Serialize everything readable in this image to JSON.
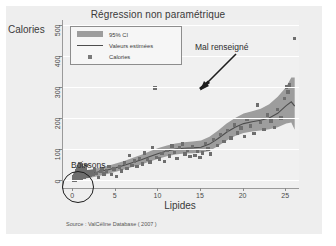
{
  "chart_data": {
    "type": "scatter",
    "title": "Régression non paramétrique",
    "xlabel": "Lipides",
    "ylabel": "Calories",
    "source": "Source : ValCéline Database ( 2007 )",
    "xlim": [
      -1.2,
      26.5
    ],
    "ylim": [
      -25,
      515
    ],
    "xticks": [
      0,
      5,
      10,
      15,
      20,
      25
    ],
    "yticks": [
      0,
      100,
      200,
      300,
      400,
      500
    ],
    "grid": "horizontal",
    "legend_position": "top-left",
    "legend": [
      {
        "key": "band",
        "label": "95% CI"
      },
      {
        "key": "line",
        "label": "Valeurs estimées"
      },
      {
        "key": "marker",
        "label": "Calories"
      }
    ],
    "annotations": [
      {
        "text": "Mal renseigné",
        "points_to": [
          9.6,
          297
        ]
      },
      {
        "text": "Boissons",
        "circles": [
          0.7,
          18
        ]
      }
    ],
    "series": [
      {
        "name": "Calories",
        "type": "scatter",
        "points": [
          [
            0.0,
            0
          ],
          [
            0.0,
            4
          ],
          [
            0.1,
            2
          ],
          [
            0.1,
            10
          ],
          [
            0.2,
            0
          ],
          [
            0.2,
            7
          ],
          [
            0.2,
            16
          ],
          [
            0.3,
            3
          ],
          [
            0.3,
            12
          ],
          [
            0.3,
            22
          ],
          [
            0.4,
            5
          ],
          [
            0.4,
            18
          ],
          [
            0.4,
            30
          ],
          [
            0.5,
            8
          ],
          [
            0.5,
            25
          ],
          [
            0.5,
            38
          ],
          [
            0.6,
            2
          ],
          [
            0.6,
            14
          ],
          [
            0.6,
            33
          ],
          [
            0.7,
            20
          ],
          [
            0.7,
            44
          ],
          [
            0.8,
            9
          ],
          [
            0.8,
            28
          ],
          [
            0.8,
            52
          ],
          [
            0.9,
            16
          ],
          [
            0.9,
            36
          ],
          [
            1.0,
            6
          ],
          [
            1.0,
            24
          ],
          [
            1.0,
            46
          ],
          [
            1.1,
            13
          ],
          [
            1.1,
            31
          ],
          [
            1.2,
            19
          ],
          [
            1.2,
            40
          ],
          [
            1.3,
            10
          ],
          [
            1.3,
            27
          ],
          [
            1.4,
            34
          ],
          [
            1.5,
            17
          ],
          [
            1.5,
            48
          ],
          [
            1.6,
            23
          ],
          [
            1.7,
            12
          ],
          [
            1.8,
            29
          ],
          [
            1.9,
            20
          ],
          [
            2.0,
            15
          ],
          [
            2.1,
            26
          ],
          [
            2.3,
            18
          ],
          [
            2.5,
            33
          ],
          [
            2.7,
            22
          ],
          [
            3.0,
            8
          ],
          [
            3.2,
            28
          ],
          [
            3.4,
            38
          ],
          [
            3.6,
            20
          ],
          [
            3.9,
            30
          ],
          [
            4.2,
            44
          ],
          [
            4.5,
            18
          ],
          [
            4.8,
            36
          ],
          [
            5.1,
            12
          ],
          [
            5.4,
            42
          ],
          [
            5.7,
            30
          ],
          [
            6.0,
            55
          ],
          [
            6.3,
            38
          ],
          [
            6.6,
            80
          ],
          [
            6.9,
            48
          ],
          [
            7.2,
            62
          ],
          [
            7.5,
            44
          ],
          [
            7.8,
            70
          ],
          [
            8.1,
            52
          ],
          [
            8.4,
            88
          ],
          [
            8.7,
            66
          ],
          [
            9.0,
            58
          ],
          [
            9.3,
            104
          ],
          [
            9.6,
            297
          ],
          [
            9.8,
            74
          ],
          [
            10.1,
            68
          ],
          [
            10.4,
            86
          ],
          [
            10.7,
            60
          ],
          [
            11.0,
            96
          ],
          [
            11.3,
            78
          ],
          [
            11.6,
            110
          ],
          [
            11.9,
            90
          ],
          [
            12.2,
            70
          ],
          [
            12.5,
            104
          ],
          [
            12.8,
            116
          ],
          [
            13.1,
            84
          ],
          [
            13.4,
            96
          ],
          [
            13.7,
            76
          ],
          [
            14.0,
            108
          ],
          [
            14.3,
            80
          ],
          [
            14.6,
            92
          ],
          [
            14.9,
            74
          ],
          [
            15.2,
            88
          ],
          [
            15.5,
            118
          ],
          [
            15.8,
            100
          ],
          [
            16.1,
            84
          ],
          [
            16.5,
            130
          ],
          [
            16.9,
            112
          ],
          [
            17.3,
            146
          ],
          [
            17.7,
            124
          ],
          [
            18.1,
            160
          ],
          [
            18.5,
            136
          ],
          [
            18.9,
            178
          ],
          [
            19.3,
            152
          ],
          [
            19.7,
            168
          ],
          [
            20.1,
            140
          ],
          [
            20.4,
            196
          ],
          [
            20.8,
            174
          ],
          [
            21.2,
            150
          ],
          [
            21.6,
            242
          ],
          [
            22.0,
            186
          ],
          [
            22.4,
            164
          ],
          [
            22.8,
            210
          ],
          [
            23.2,
            190
          ],
          [
            23.6,
            170
          ],
          [
            24.0,
            228
          ],
          [
            24.4,
            200
          ],
          [
            24.8,
            262
          ],
          [
            25.0,
            300
          ],
          [
            25.2,
            284
          ],
          [
            25.4,
            306
          ],
          [
            26.0,
            455
          ]
        ]
      },
      {
        "name": "Valeurs estimées",
        "type": "line",
        "points": [
          [
            0,
            12
          ],
          [
            1,
            16
          ],
          [
            2,
            21
          ],
          [
            3,
            27
          ],
          [
            4,
            33
          ],
          [
            5,
            40
          ],
          [
            6,
            48
          ],
          [
            7,
            57
          ],
          [
            8,
            66
          ],
          [
            9,
            76
          ],
          [
            10,
            86
          ],
          [
            11,
            94
          ],
          [
            12,
            100
          ],
          [
            13,
            103
          ],
          [
            14,
            104
          ],
          [
            15,
            106
          ],
          [
            16,
            116
          ],
          [
            17,
            134
          ],
          [
            18,
            154
          ],
          [
            19,
            170
          ],
          [
            20,
            182
          ],
          [
            21,
            188
          ],
          [
            22,
            193
          ],
          [
            23,
            200
          ],
          [
            24,
            215
          ],
          [
            25,
            240
          ],
          [
            25.6,
            252
          ],
          [
            26,
            238
          ]
        ]
      },
      {
        "name": "95% CI",
        "type": "band",
        "upper": [
          [
            0,
            26
          ],
          [
            1,
            30
          ],
          [
            2,
            34
          ],
          [
            3,
            40
          ],
          [
            4,
            46
          ],
          [
            5,
            54
          ],
          [
            6,
            62
          ],
          [
            7,
            72
          ],
          [
            8,
            82
          ],
          [
            9,
            93
          ],
          [
            10,
            104
          ],
          [
            11,
            112
          ],
          [
            12,
            118
          ],
          [
            13,
            122
          ],
          [
            14,
            124
          ],
          [
            15,
            128
          ],
          [
            16,
            140
          ],
          [
            17,
            160
          ],
          [
            18,
            182
          ],
          [
            19,
            200
          ],
          [
            20,
            214
          ],
          [
            21,
            222
          ],
          [
            22,
            230
          ],
          [
            23,
            244
          ],
          [
            24,
            268
          ],
          [
            25,
            300
          ],
          [
            25.6,
            330
          ],
          [
            26,
            330
          ]
        ],
        "lower": [
          [
            0,
            0
          ],
          [
            1,
            4
          ],
          [
            2,
            8
          ],
          [
            3,
            14
          ],
          [
            4,
            20
          ],
          [
            5,
            27
          ],
          [
            6,
            34
          ],
          [
            7,
            43
          ],
          [
            8,
            51
          ],
          [
            9,
            60
          ],
          [
            10,
            69
          ],
          [
            11,
            77
          ],
          [
            12,
            83
          ],
          [
            13,
            86
          ],
          [
            14,
            87
          ],
          [
            15,
            88
          ],
          [
            16,
            94
          ],
          [
            17,
            110
          ],
          [
            18,
            128
          ],
          [
            19,
            142
          ],
          [
            20,
            152
          ],
          [
            21,
            157
          ],
          [
            22,
            160
          ],
          [
            23,
            164
          ],
          [
            24,
            170
          ],
          [
            25,
            182
          ],
          [
            25.6,
            186
          ],
          [
            26,
            162
          ]
        ]
      }
    ],
    "colors": {
      "band": "#9d9d9d",
      "line": "#4d4d4d",
      "marker": "#6e6e6e",
      "plot_background": "#f0f0f0",
      "canvas_background": "#eeeeee",
      "grid": "#ffffff",
      "annotation": "#1d1d1d"
    }
  }
}
